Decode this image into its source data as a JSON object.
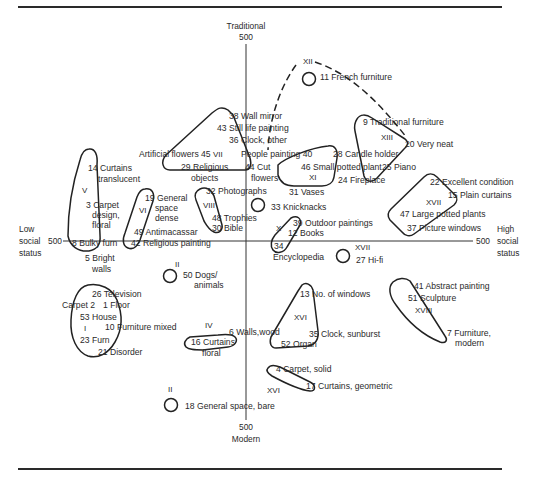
{
  "axes": {
    "top": {
      "label": "Traditional",
      "value": "500"
    },
    "bottom": {
      "label": "Modern",
      "value": "500"
    },
    "left": {
      "label_lines": [
        "Low",
        "social",
        "status"
      ],
      "value": "500"
    },
    "right": {
      "label_lines": [
        "High",
        "social",
        "status"
      ],
      "value": "500"
    }
  },
  "items": [
    {
      "id": "i11",
      "text": "11 French furniture",
      "x": 320,
      "y": 80
    },
    {
      "id": "i38",
      "text": "38 Wall mirror",
      "x": 229,
      "y": 119
    },
    {
      "id": "i43",
      "text": "43 Still life painting",
      "x": 217,
      "y": 131
    },
    {
      "id": "i36",
      "text": "36 Clock, other",
      "x": 229,
      "y": 143
    },
    {
      "id": "i45",
      "text": "Artificial flowers 45",
      "x": 139,
      "y": 157
    },
    {
      "id": "i40",
      "text": "People painting 40",
      "x": 241,
      "y": 157
    },
    {
      "id": "i28",
      "text": "28 Candle holder",
      "x": 333,
      "y": 157
    },
    {
      "id": "i9",
      "text": "9 Traditional furniture",
      "x": 363,
      "y": 125
    },
    {
      "id": "i20",
      "text": "20 Very neat",
      "x": 405,
      "y": 147
    },
    {
      "id": "i29a",
      "text": "29 Religious",
      "x": 181,
      "y": 170
    },
    {
      "id": "i29b",
      "text": "objects",
      "x": 191,
      "y": 181
    },
    {
      "id": "i44a",
      "text": "44 Cut",
      "x": 245,
      "y": 170
    },
    {
      "id": "i44b",
      "text": "flowers",
      "x": 251,
      "y": 181
    },
    {
      "id": "i46",
      "text": "46 Small potted plant",
      "x": 301,
      "y": 170
    },
    {
      "id": "i25",
      "text": "25 Piano",
      "x": 382,
      "y": 170
    },
    {
      "id": "i24",
      "text": "24 Fireplace",
      "x": 338,
      "y": 183
    },
    {
      "id": "i14a",
      "text": "14 Curtains",
      "x": 88,
      "y": 171
    },
    {
      "id": "i14b",
      "text": "translucent",
      "x": 98,
      "y": 182
    },
    {
      "id": "i22",
      "text": "22 Excellent condition",
      "x": 430,
      "y": 185
    },
    {
      "id": "i15",
      "text": "15 Plain curtains",
      "x": 448,
      "y": 198
    },
    {
      "id": "i31",
      "text": "31 Vases",
      "x": 289,
      "y": 195
    },
    {
      "id": "i32",
      "text": "32 Photographs",
      "x": 206,
      "y": 194
    },
    {
      "id": "i19a",
      "text": "19 General",
      "x": 145,
      "y": 201
    },
    {
      "id": "i19b",
      "text": "space",
      "x": 155,
      "y": 211
    },
    {
      "id": "i19c",
      "text": "dense",
      "x": 155,
      "y": 221
    },
    {
      "id": "i3a",
      "text": "3 Carpet",
      "x": 86,
      "y": 208
    },
    {
      "id": "i3b",
      "text": "design,",
      "x": 92,
      "y": 218
    },
    {
      "id": "i3c",
      "text": "floral",
      "x": 92,
      "y": 228
    },
    {
      "id": "i33",
      "text": "33 Knicknacks",
      "x": 271,
      "y": 210
    },
    {
      "id": "i47",
      "text": "47 Large potted plants",
      "x": 400,
      "y": 217
    },
    {
      "id": "i48",
      "text": "48 Trophies",
      "x": 212,
      "y": 221
    },
    {
      "id": "i30",
      "text": "30 Bible",
      "x": 212,
      "y": 231
    },
    {
      "id": "i39",
      "text": "39 Outdoor paintings",
      "x": 293,
      "y": 226
    },
    {
      "id": "i12",
      "text": "12 Books",
      "x": 288,
      "y": 236
    },
    {
      "id": "i49",
      "text": "49 Antimacassar",
      "x": 134,
      "y": 235
    },
    {
      "id": "i37",
      "text": "37 Picture windows",
      "x": 407,
      "y": 231
    },
    {
      "id": "i8",
      "text": "8 Bulky furn",
      "x": 72,
      "y": 246
    },
    {
      "id": "i42",
      "text": "42 Religious painting",
      "x": 131,
      "y": 246
    },
    {
      "id": "i34",
      "text": "34",
      "x": 274,
      "y": 249
    },
    {
      "id": "i34b",
      "text": "Encyclopedia",
      "x": 273,
      "y": 260
    },
    {
      "id": "i27",
      "text": "27 Hi-fi",
      "x": 356,
      "y": 263
    },
    {
      "id": "i5a",
      "text": "5 Bright",
      "x": 85,
      "y": 261
    },
    {
      "id": "i5b",
      "text": "walls",
      "x": 92,
      "y": 272
    },
    {
      "id": "i50a",
      "text": "50 Dogs/",
      "x": 183,
      "y": 278
    },
    {
      "id": "i50b",
      "text": "animals",
      "x": 194,
      "y": 288
    },
    {
      "id": "i41",
      "text": "41 Abstract painting",
      "x": 414,
      "y": 289
    },
    {
      "id": "i26",
      "text": "26 Television",
      "x": 92,
      "y": 297
    },
    {
      "id": "i13",
      "text": "13 No. of windows",
      "x": 300,
      "y": 297
    },
    {
      "id": "i2",
      "text": "Carpet 2",
      "x": 62,
      "y": 308
    },
    {
      "id": "i1",
      "text": "1 Floor",
      "x": 103,
      "y": 308
    },
    {
      "id": "i51",
      "text": "51 Sculpture",
      "x": 408,
      "y": 301
    },
    {
      "id": "i53",
      "text": "53 House",
      "x": 80,
      "y": 320
    },
    {
      "id": "i10",
      "text": "10 Furniture mixed",
      "x": 105,
      "y": 330
    },
    {
      "id": "i6",
      "text": "6 Walls,wood",
      "x": 229,
      "y": 335
    },
    {
      "id": "i7a",
      "text": "7 Furniture,",
      "x": 447,
      "y": 336
    },
    {
      "id": "i7b",
      "text": "modern",
      "x": 455,
      "y": 346
    },
    {
      "id": "i23",
      "text": "23 Furn",
      "x": 80,
      "y": 343
    },
    {
      "id": "i16a",
      "text": "16 Curtains",
      "x": 191,
      "y": 345
    },
    {
      "id": "i16b",
      "text": "floral",
      "x": 202,
      "y": 356
    },
    {
      "id": "i35",
      "text": "35 Clock, sunburst",
      "x": 309,
      "y": 337
    },
    {
      "id": "i52",
      "text": "52 Organ",
      "x": 281,
      "y": 347
    },
    {
      "id": "i21",
      "text": "21 Disorder",
      "x": 98,
      "y": 355
    },
    {
      "id": "i4",
      "text": "4 Carpet, solid",
      "x": 276,
      "y": 372
    },
    {
      "id": "i17",
      "text": "17 Curtains, geometric",
      "x": 306,
      "y": 389
    },
    {
      "id": "i18",
      "text": "18 General space, bare",
      "x": 185,
      "y": 409
    }
  ],
  "clusters": [
    {
      "id": "XII",
      "x": 303,
      "y": 64
    },
    {
      "id": "VII",
      "x": 213,
      "y": 157
    },
    {
      "id": "XIII",
      "x": 381,
      "y": 140
    },
    {
      "id": "XI",
      "x": 309,
      "y": 180
    },
    {
      "id": "V",
      "x": 82,
      "y": 193
    },
    {
      "id": "VI",
      "x": 139,
      "y": 213
    },
    {
      "id": "VIII",
      "x": 203,
      "y": 208
    },
    {
      "id": "XVII",
      "x": 426,
      "y": 205
    },
    {
      "id": "X",
      "x": 276,
      "y": 231
    },
    {
      "id": "XVII",
      "x": 355,
      "y": 250
    },
    {
      "id": "II",
      "x": 175,
      "y": 267
    },
    {
      "id": "I",
      "x": 84,
      "y": 331
    },
    {
      "id": "XVIII",
      "x": 415,
      "y": 313
    },
    {
      "id": "XVI",
      "x": 294,
      "y": 320
    },
    {
      "id": "IV",
      "x": 205,
      "y": 328
    },
    {
      "id": "XVI",
      "x": 267,
      "y": 393
    },
    {
      "id": "II",
      "x": 168,
      "y": 392
    }
  ]
}
